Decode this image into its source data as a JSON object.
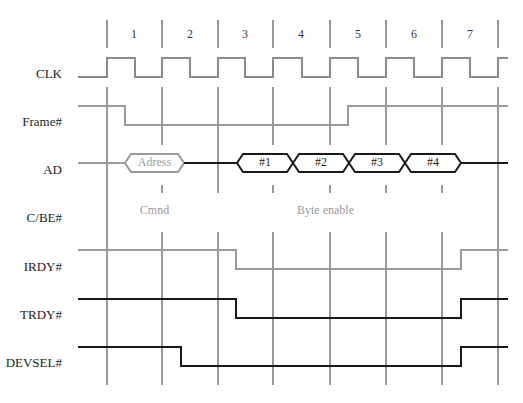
{
  "diagram": {
    "type": "timing-diagram",
    "cycle_numbers": [
      "1",
      "2",
      "3",
      "4",
      "5",
      "6",
      "7"
    ],
    "signals": [
      {
        "name": "CLK",
        "label": "CLK"
      },
      {
        "name": "frame",
        "label": "Frame#"
      },
      {
        "name": "ad",
        "label": "AD"
      },
      {
        "name": "cbe",
        "label": "C/BE#"
      },
      {
        "name": "irdy",
        "label": "IRDY#"
      },
      {
        "name": "trdy",
        "label": "TRDY#"
      },
      {
        "name": "devsel",
        "label": "DEVSEL#"
      }
    ],
    "ad_bus": {
      "address": "Adress",
      "data": [
        "#1",
        "#2",
        "#3",
        "#4"
      ]
    },
    "cbe_bus": {
      "command": "Cmnd",
      "byte_enable": "Byte enable"
    },
    "colors": {
      "initiator": "#9a9a9a",
      "target": "#1a1a1a",
      "gridline": "#333333"
    }
  }
}
